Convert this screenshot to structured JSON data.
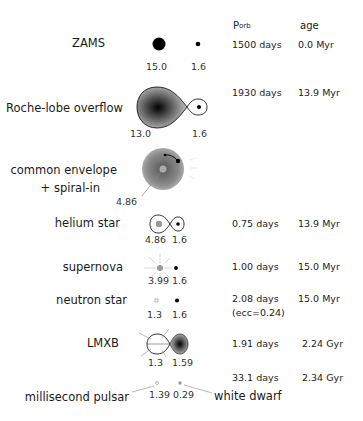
{
  "header": {
    "porb_main": "P",
    "porb_sub": "orb",
    "age": "age"
  },
  "stages": [
    {
      "label": "ZAMS",
      "masses": [
        "15.0",
        "1.6"
      ],
      "porb": "1500 days",
      "age": "0.0 Myr"
    },
    {
      "label": "Roche-lobe overflow",
      "masses": [
        "13.0",
        "1.6"
      ],
      "porb": "1930 days",
      "age": "13.9 Myr"
    },
    {
      "label_line1": "common envelope",
      "label_line2": "+ spiral-in",
      "masses": [
        "4.86"
      ]
    },
    {
      "label": "helium star",
      "masses": [
        "4.86",
        "1.6"
      ],
      "porb": "0.75 days",
      "age": "13.9 Myr"
    },
    {
      "label": "supernova",
      "masses": [
        "3.99",
        "1.6"
      ],
      "porb": "1.00 days",
      "age": "15.0 Myr"
    },
    {
      "label": "neutron star",
      "masses": [
        "1.3",
        "1.6"
      ],
      "porb": "2.08 days",
      "porb_note": "(ecc=0.24)",
      "age": "15.0 Myr"
    },
    {
      "label": "LMXB",
      "masses": [
        "1.3",
        "1.59"
      ],
      "porb": "1.91 days",
      "age": "2.24 Gyr"
    },
    {
      "label": "millisecond pulsar",
      "label_right": "white dwarf",
      "masses": [
        "1.39",
        "0.29"
      ],
      "porb": "33.1 days",
      "age": "2.34 Gyr"
    }
  ]
}
